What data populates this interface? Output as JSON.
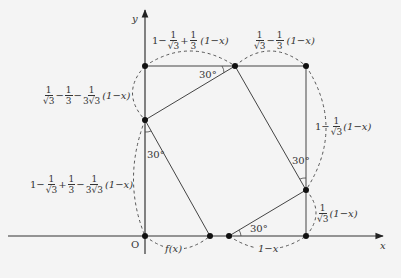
{
  "diagram": {
    "axes": {
      "x_label": "x",
      "y_label": "y",
      "origin_label": "O"
    },
    "angles": {
      "top": "30°",
      "left": "30°",
      "right": "30°",
      "bottom": "30°"
    },
    "labels": {
      "top_left_segment": {
        "prefix": "1−",
        "f1_num": "1",
        "f1_den": "√3",
        "op": "+",
        "f2_num": "1",
        "f2_den": "3",
        "suffix": "(1−x)"
      },
      "top_right_segment": {
        "f1_num": "1",
        "f1_den": "√3",
        "op": "−",
        "f2_num": "1",
        "f2_den": "3",
        "suffix": "(1−x)"
      },
      "left_upper_segment": {
        "f1_num": "1",
        "f1_den": "√3",
        "op1": "−",
        "f2_num": "1",
        "f2_den": "3",
        "op2": "−",
        "f3_num": "1",
        "f3_den": "3√3",
        "suffix": "(1−x)"
      },
      "left_lower_segment": {
        "prefix": "1−",
        "f1_num": "1",
        "f1_den": "√3",
        "op1": "+",
        "f2_num": "1",
        "f2_den": "3",
        "op2": "−",
        "f3_num": "1",
        "f3_den": "3√3",
        "suffix": "(1−x)"
      },
      "right_upper_segment": {
        "prefix": "1−",
        "f1_num": "1",
        "f1_den": "√3",
        "suffix": "(1−x)"
      },
      "right_lower_segment": {
        "f1_num": "1",
        "f1_den": "√3",
        "suffix": "(1−x)"
      },
      "bottom_left_segment": "f(x)",
      "bottom_right_segment": "1−x"
    }
  }
}
